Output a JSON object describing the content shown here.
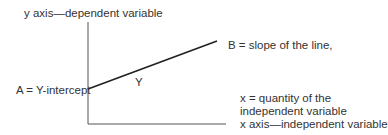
{
  "diagram": {
    "labels": {
      "y_axis": "y axis—dependent variable",
      "slope": "B = slope of the line,",
      "intercept": "A = Y-intercept",
      "line_label": "Y",
      "x_quantity_line1": "x = quantity of the",
      "x_quantity_line2": "independent variable",
      "x_axis": "x axis—independent variable"
    },
    "colors": {
      "axis": "#555555",
      "line": "#222222",
      "text": "#333333"
    },
    "geometry": {
      "y_axis": {
        "x": 88,
        "y_top": 22,
        "y_bottom": 124
      },
      "x_axis": {
        "y": 124,
        "x_left": 88,
        "x_right": 226
      },
      "regression_line": {
        "x1": 88,
        "y1": 89,
        "x2": 217,
        "y2": 41
      }
    }
  }
}
